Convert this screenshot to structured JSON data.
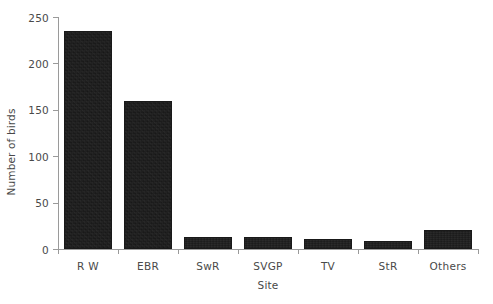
{
  "chart_data": {
    "type": "bar",
    "title": "",
    "xlabel": "Site",
    "ylabel": "Number of birds",
    "categories": [
      "R W",
      "EBR",
      "SwR",
      "SVGP",
      "TV",
      "StR",
      "Others"
    ],
    "values": [
      235,
      160,
      13,
      13,
      11,
      9,
      20
    ],
    "series": [
      {
        "name": "Number of birds",
        "values": [
          235,
          160,
          13,
          13,
          11,
          9,
          20
        ]
      }
    ],
    "ylim": [
      0,
      250
    ],
    "yticks": [
      0,
      50,
      100,
      150,
      200,
      250
    ],
    "ytick_labels": [
      "0",
      "50",
      "100",
      "150",
      "200",
      "250"
    ],
    "grid": false,
    "legend": false,
    "legend_position": "none",
    "bar_color": "#1b1b1b",
    "axis_color": "#9a9a9a",
    "text_color": "#494949",
    "background_color": "#ffffff"
  }
}
